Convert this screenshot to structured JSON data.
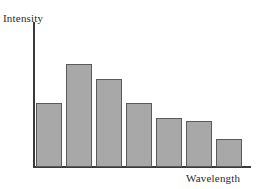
{
  "chart_data": {
    "type": "bar",
    "title": "",
    "subtitle": "",
    "xlabel": "Wavelength",
    "ylabel": "Intensity",
    "categories": [
      "1",
      "2",
      "3",
      "4",
      "5",
      "6",
      "7"
    ],
    "values": [
      64,
      103,
      88,
      64,
      49,
      46,
      28
    ],
    "ylim": [
      0,
      145
    ],
    "xlim": [
      0,
      7
    ],
    "grid": false,
    "legend": null,
    "legend_position": "none",
    "tick_labels": {
      "x": [],
      "y": []
    },
    "annotations": [],
    "series": [
      {
        "name": "Intensity",
        "values": [
          64,
          103,
          88,
          64,
          49,
          46,
          28
        ]
      }
    ],
    "style": {
      "bar_fill": "#a8a8a8",
      "bar_stroke": "#5a5a5a",
      "axis_color": "#3a3a3a",
      "background": "#ffffff",
      "bar_width_px": 26,
      "bar_gap_px": 4,
      "baseline_y_px": 167,
      "plot_left_px": 36
    }
  }
}
